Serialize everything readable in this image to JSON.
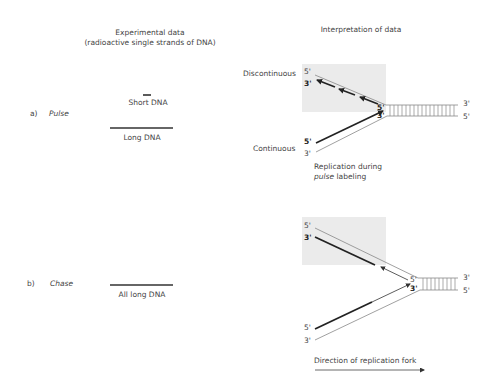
{
  "headers": {
    "left_line1": "Experimental data",
    "left_line2": "(radioactive single strands of DNA)",
    "right": "Interpretation of data"
  },
  "panel_a": {
    "letter": "a)",
    "name": "Pulse",
    "short_label": "Short DNA",
    "long_label": "Long DNA",
    "discontinuous_label": "Discontinuous",
    "continuous_label": "Continuous",
    "caption_line1": "Replication during",
    "caption_italic": "pulse",
    "caption_rest": " labeling",
    "ends": {
      "top_5": "5'",
      "top_3": "3'",
      "fork_5": "5'",
      "fork_3": "3'",
      "bot_5": "5'",
      "bot_3": "3'",
      "right_3": "3'",
      "right_5": "5'"
    }
  },
  "panel_b": {
    "letter": "b)",
    "name": "Chase",
    "long_label": "All long DNA",
    "ends": {
      "top_5": "5'",
      "top_3": "3'",
      "fork_5": "5'",
      "fork_3": "3'",
      "bot_5": "5'",
      "bot_3": "3'",
      "right_3": "3'",
      "right_5": "5'"
    },
    "direction_label": "Direction of replication fork"
  },
  "colors": {
    "shade": "#ebebeb",
    "new_strand": "#222222",
    "parental": "#888888",
    "text": "#444444"
  }
}
